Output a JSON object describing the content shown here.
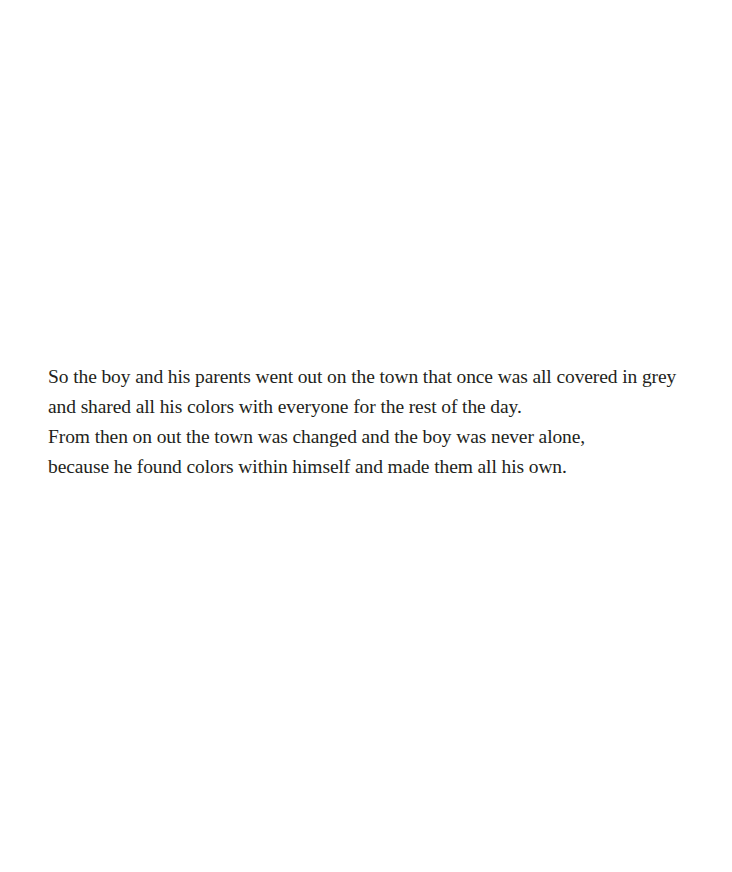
{
  "page": {
    "background_color": "#ffffff",
    "text_color": "#231f20"
  },
  "verse": {
    "lines": [
      "So the boy and his parents went out on the town that once was all covered in grey",
      "and shared all his colors with everyone for the rest of the day.",
      "From then on out the town was changed and the boy was never alone,",
      "because he found colors within himself and made them all his own."
    ]
  }
}
